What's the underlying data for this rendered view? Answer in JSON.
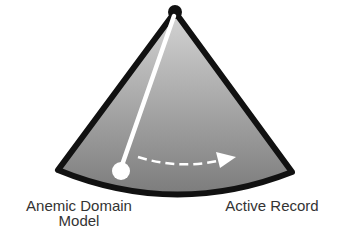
{
  "diagram": {
    "type": "pendulum-spectrum",
    "labels": {
      "left_line1": "Anemic Domain",
      "left_line2": "Model",
      "right": "Active Record"
    },
    "colors": {
      "outline": "#111111",
      "gradient_top": "#d4d4d4",
      "gradient_bottom": "#7c7c7c",
      "rod": "#ffffff",
      "bob": "#ffffff",
      "arrow": "#ffffff",
      "text": "#333333"
    },
    "geometry": {
      "pivot": [
        175,
        12
      ],
      "left_corner": [
        58,
        170
      ],
      "right_corner": [
        292,
        172
      ],
      "arc_bottom_y": 195,
      "bob": [
        121,
        171
      ],
      "bob_radius": 9,
      "arrow_start": [
        138,
        157
      ],
      "arrow_end": [
        234,
        157
      ]
    }
  }
}
